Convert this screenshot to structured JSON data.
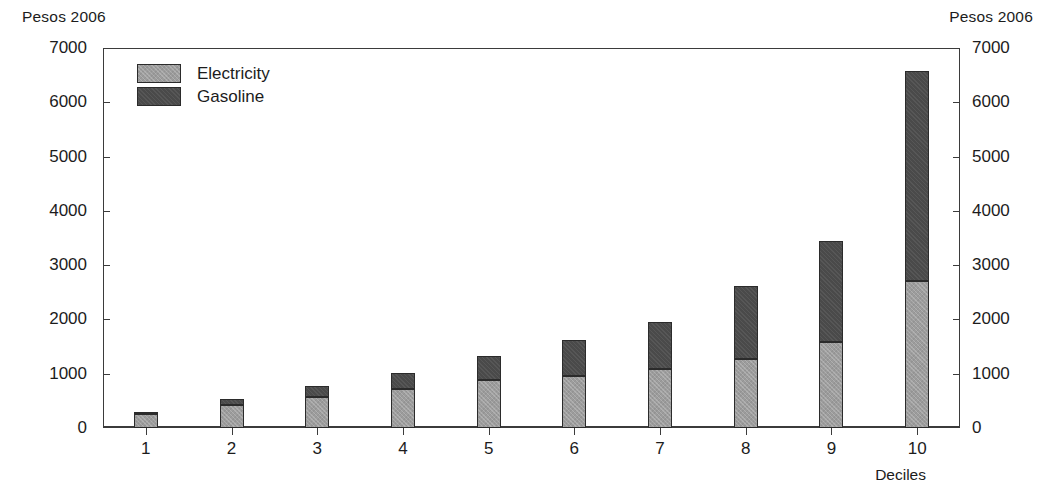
{
  "axes": {
    "unit_label_left": "Pesos 2006",
    "unit_label_right": "Pesos 2006",
    "xaxis_title": "Deciles"
  },
  "legend": {
    "items": [
      {
        "label": "Electricity",
        "color": "#9c9c9c"
      },
      {
        "label": "Gasoline",
        "color": "#4a4a4a"
      }
    ]
  },
  "chart_data": {
    "type": "bar",
    "stacked": true,
    "title": "",
    "subtitle": "",
    "xlabel": "Deciles",
    "ylabel": "Pesos 2006",
    "y2label": "Pesos 2006",
    "ylim": [
      0,
      7000
    ],
    "yticks": [
      0,
      1000,
      2000,
      3000,
      4000,
      5000,
      6000,
      7000
    ],
    "ytick_labels": [
      "0",
      "1000",
      "2000",
      "3000",
      "4000",
      "5000",
      "6000",
      "7000"
    ],
    "y2ticks": [
      0,
      1000,
      2000,
      3000,
      4000,
      5000,
      6000,
      7000
    ],
    "y2tick_labels": [
      "0",
      "1000",
      "2000",
      "3000",
      "4000",
      "5000",
      "6000",
      "7000"
    ],
    "grid": false,
    "legend_position": "top-left inside",
    "categories": [
      "1",
      "2",
      "3",
      "4",
      "5",
      "6",
      "7",
      "8",
      "9",
      "10"
    ],
    "series": [
      {
        "name": "Electricity",
        "color": "#9c9c9c",
        "values": [
          250,
          430,
          580,
          720,
          880,
          960,
          1090,
          1280,
          1580,
          2700
        ]
      },
      {
        "name": "Gasoline",
        "color": "#4a4a4a",
        "values": [
          50,
          110,
          190,
          300,
          450,
          670,
          870,
          1330,
          1870,
          3870
        ]
      }
    ],
    "totals": [
      300,
      540,
      770,
      1020,
      1330,
      1630,
      1960,
      2610,
      3450,
      6570
    ]
  }
}
